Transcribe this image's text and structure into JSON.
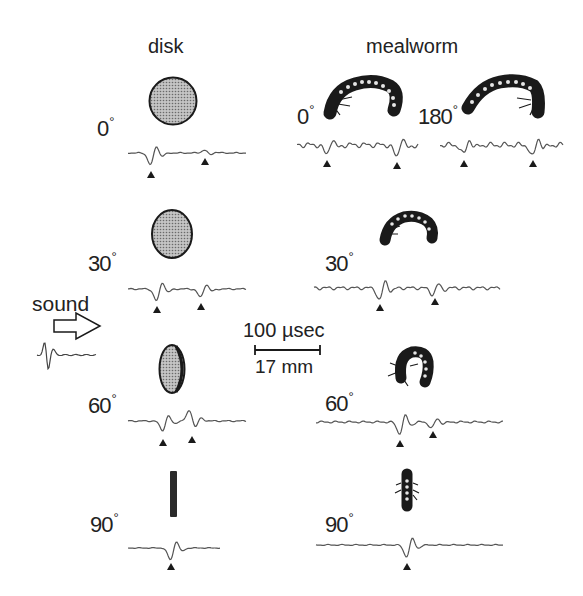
{
  "figure": {
    "column_headers": {
      "disk": "disk",
      "mealworm": "mealworm"
    },
    "stimulus_label": "sound",
    "scale_bar": {
      "time": "100 µsec",
      "distance": "17 mm"
    },
    "panels": [
      {
        "id": "disk-0",
        "object": "disk",
        "angle": "0",
        "marker_count": 2
      },
      {
        "id": "mealworm-0",
        "object": "mealworm",
        "angle": "0",
        "marker_count": 2
      },
      {
        "id": "mealworm-180",
        "object": "mealworm",
        "angle": "180",
        "marker_count": 2
      },
      {
        "id": "disk-30",
        "object": "disk",
        "angle": "30",
        "marker_count": 2
      },
      {
        "id": "mealworm-30",
        "object": "mealworm",
        "angle": "30",
        "marker_count": 2
      },
      {
        "id": "disk-60",
        "object": "disk",
        "angle": "60",
        "marker_count": 2
      },
      {
        "id": "mealworm-60",
        "object": "mealworm",
        "angle": "60",
        "marker_count": 2
      },
      {
        "id": "disk-90",
        "object": "disk",
        "angle": "90",
        "marker_count": 1
      },
      {
        "id": "mealworm-90",
        "object": "mealworm",
        "angle": "90",
        "marker_count": 1
      }
    ],
    "degree_symbol": "°",
    "colors": {
      "ink": "#1a1a1a",
      "disk_fill": "#a8a8a8",
      "background": "#ffffff"
    }
  }
}
